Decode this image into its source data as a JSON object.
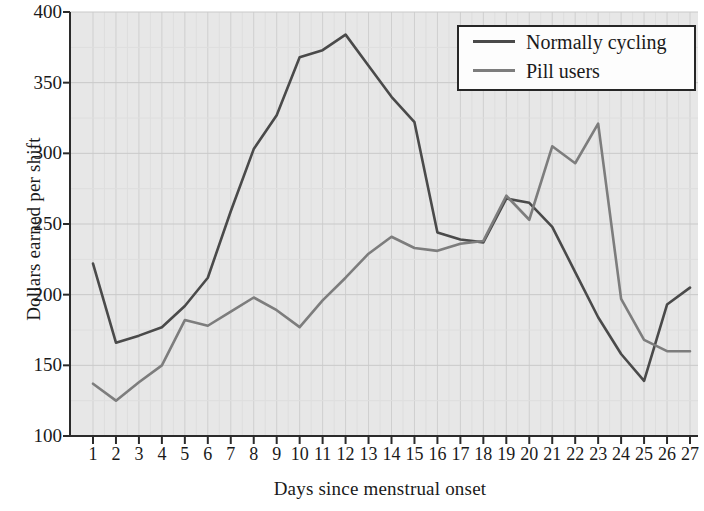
{
  "chart_data": {
    "type": "line",
    "title": "",
    "xlabel": "Days since menstrual onset",
    "ylabel": "Dollars earned per shift",
    "x": [
      1,
      2,
      3,
      4,
      5,
      6,
      7,
      8,
      9,
      10,
      11,
      12,
      13,
      14,
      15,
      16,
      17,
      18,
      19,
      20,
      21,
      22,
      23,
      24,
      25,
      26,
      27
    ],
    "categories": [
      "1",
      "2",
      "3",
      "4",
      "5",
      "6",
      "7",
      "8",
      "9",
      "10",
      "11",
      "12",
      "13",
      "14",
      "15",
      "16",
      "17",
      "18",
      "19",
      "20",
      "21",
      "22",
      "23",
      "24",
      "25",
      "26",
      "27"
    ],
    "xlim": [
      1,
      27
    ],
    "ylim": [
      100,
      400
    ],
    "yticks": [
      100,
      150,
      200,
      250,
      300,
      350,
      400
    ],
    "ytick_labels": [
      "100",
      "150",
      "200",
      "250",
      "300",
      "350",
      "400"
    ],
    "xticks": [
      1,
      2,
      3,
      4,
      5,
      6,
      7,
      8,
      9,
      10,
      11,
      12,
      13,
      14,
      15,
      16,
      17,
      18,
      19,
      20,
      21,
      22,
      23,
      24,
      25,
      26,
      27
    ],
    "grid": true,
    "grid_major_y": true,
    "grid_minor_x": true,
    "legend_position": "top-right",
    "plot_background": "#e7e7e7",
    "series": [
      {
        "name": "Normally cycling",
        "color": "#4a4a4a",
        "values": [
          222,
          166,
          171,
          177,
          192,
          212,
          259,
          303,
          327,
          368,
          373,
          384,
          362,
          340,
          322,
          244,
          239,
          237,
          268,
          265,
          248,
          216,
          184,
          158,
          139,
          193,
          205
        ]
      },
      {
        "name": "Pill users",
        "color": "#7d7d7d",
        "values": [
          137,
          125,
          138,
          150,
          182,
          178,
          188,
          198,
          189,
          177,
          196,
          212,
          229,
          241,
          233,
          231,
          236,
          238,
          270,
          253,
          305,
          293,
          321,
          197,
          168,
          160,
          160
        ]
      }
    ]
  },
  "legend": {
    "items": [
      {
        "label": "Normally cycling",
        "color": "#4a4a4a"
      },
      {
        "label": "Pill users",
        "color": "#7d7d7d"
      }
    ]
  },
  "axes": {
    "ylabel": "Dollars earned per shift",
    "xlabel": "Days since menstrual onset"
  }
}
